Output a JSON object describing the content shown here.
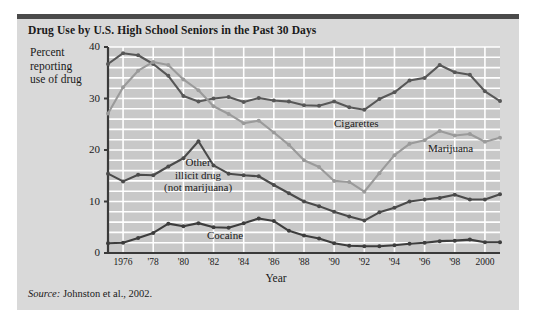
{
  "figure": {
    "title": "Drug Use by U.S. High School Seniors in the Past 30 Days",
    "source_word": "Source:",
    "source_text": " Johnston et al., 2002.",
    "background_color": "#d9d9d9",
    "rule_color": "#4a4a4a"
  },
  "axis_caption": {
    "line1": "Percent",
    "line2": "reporting",
    "line3": "use of drug"
  },
  "labels": {
    "other_line1": "Other",
    "other_line2": "illicit drug",
    "other_line3": "(not marijuana)",
    "cocaine": "Cocaine",
    "cigarettes": "Cigarettes",
    "marijuana": "Marijuana"
  },
  "chart_data": {
    "type": "line",
    "title": "Drug Use by U.S. High School Seniors in the Past 30 Days",
    "xlabel": "Year",
    "ylabel": "Percent reporting use of drug",
    "xlim": [
      1975,
      2001
    ],
    "ylim": [
      0,
      40
    ],
    "yticks": [
      0,
      10,
      20,
      30,
      40
    ],
    "ytick_labels": [
      "0",
      "10",
      "20",
      "30",
      "40"
    ],
    "xticks": [
      1976,
      1978,
      1980,
      1982,
      1984,
      1986,
      1988,
      1990,
      1992,
      1994,
      1996,
      1998,
      2000
    ],
    "xtick_labels": [
      "1976",
      "'78",
      "'80",
      "'82",
      "'84",
      "'86",
      "'88",
      "'90",
      "'92",
      "'94",
      "'96",
      "'98",
      "2000"
    ],
    "grid": true,
    "grid_color": "#ffffff",
    "plot_background": "#c8c8c8",
    "legend": "inline-annotations",
    "x": [
      1975,
      1976,
      1977,
      1978,
      1979,
      1980,
      1981,
      1982,
      1983,
      1984,
      1985,
      1986,
      1987,
      1988,
      1989,
      1990,
      1991,
      1992,
      1993,
      1994,
      1995,
      1996,
      1997,
      1998,
      1999,
      2000,
      2001
    ],
    "series": [
      {
        "name": "Cigarettes",
        "color": "#575757",
        "values": [
          36.7,
          38.8,
          38.4,
          36.7,
          34.4,
          30.5,
          29.4,
          30.0,
          30.3,
          29.3,
          30.1,
          29.6,
          29.4,
          28.7,
          28.6,
          29.4,
          28.3,
          27.8,
          29.9,
          31.2,
          33.5,
          34.0,
          36.5,
          35.1,
          34.6,
          31.4,
          29.5
        ]
      },
      {
        "name": "Marijuana",
        "color": "#9a9a9a",
        "values": [
          27.1,
          32.2,
          35.4,
          37.1,
          36.5,
          33.7,
          31.6,
          28.5,
          27.0,
          25.2,
          25.7,
          23.4,
          21.0,
          18.0,
          16.7,
          14.0,
          13.8,
          11.9,
          15.5,
          19.0,
          21.2,
          21.9,
          23.7,
          22.8,
          23.1,
          21.6,
          22.4
        ]
      },
      {
        "name": "Other illicit drug (not marijuana)",
        "color": "#4a4a4a",
        "values": [
          15.4,
          13.9,
          15.2,
          15.1,
          16.8,
          18.4,
          21.7,
          17.0,
          15.4,
          15.1,
          14.9,
          13.2,
          11.6,
          10.0,
          9.1,
          8.0,
          7.1,
          6.3,
          7.9,
          8.8,
          10.0,
          10.4,
          10.7,
          11.3,
          10.4,
          10.4,
          11.4
        ]
      },
      {
        "name": "Cocaine",
        "color": "#3d3d3d",
        "values": [
          1.9,
          2.0,
          2.9,
          3.9,
          5.7,
          5.2,
          5.8,
          5.0,
          4.9,
          5.8,
          6.7,
          6.2,
          4.3,
          3.4,
          2.8,
          1.9,
          1.4,
          1.3,
          1.3,
          1.5,
          1.8,
          2.0,
          2.3,
          2.4,
          2.6,
          2.1,
          2.1
        ]
      }
    ]
  }
}
